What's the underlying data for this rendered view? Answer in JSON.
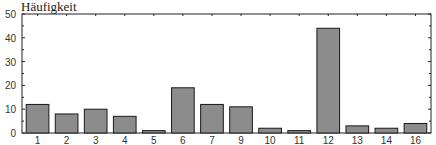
{
  "chart_data": {
    "type": "bar",
    "title": "",
    "xlabel": "",
    "ylabel": "Häufigkeit",
    "ylim": [
      0,
      50
    ],
    "yticks": [
      0,
      10,
      20,
      30,
      40,
      50
    ],
    "grid": false,
    "legend": null,
    "categories": [
      "1",
      "2",
      "3",
      "4",
      "5",
      "6",
      "7",
      "9",
      "10",
      "11",
      "12",
      "13",
      "14",
      "16"
    ],
    "values": [
      12,
      8,
      10,
      7,
      1,
      19,
      12,
      11,
      2,
      1,
      44,
      3,
      2,
      4
    ],
    "bar_color": "#8c8c8c",
    "bar_edge_color": "#1a1a1a"
  }
}
